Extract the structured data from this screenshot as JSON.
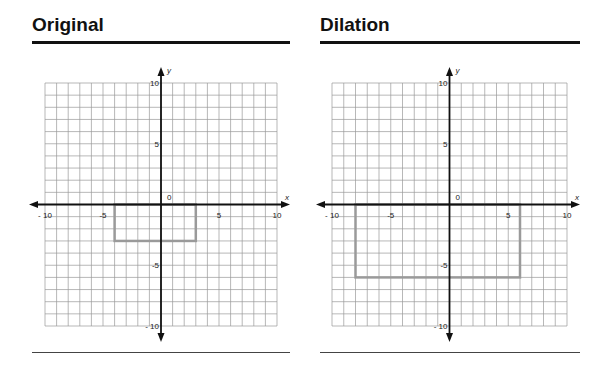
{
  "panels": [
    {
      "title": "Original",
      "x_axis_label": "x",
      "y_axis_label": "y",
      "origin_label": "0",
      "x_ticks": [
        "- 10",
        "-5",
        "5",
        "10"
      ],
      "y_ticks": [
        "10",
        "5",
        "-5",
        "- 10"
      ],
      "shape": {
        "x1": -4,
        "y1": 0,
        "x2": 3,
        "y2": -3
      }
    },
    {
      "title": "Dilation",
      "x_axis_label": "x",
      "y_axis_label": "y",
      "origin_label": "0",
      "x_ticks": [
        "- 10",
        "-5",
        "5",
        "10"
      ],
      "y_ticks": [
        "10",
        "5",
        "-5",
        "- 10"
      ],
      "shape": {
        "x1": -8,
        "y1": 0,
        "x2": 6,
        "y2": -6
      }
    }
  ],
  "colors": {
    "grid": "#9a9a9a",
    "axis": "#111111",
    "shape": "#9a9a9a"
  },
  "chart_data": [
    {
      "type": "scatter",
      "title": "Original",
      "xlabel": "x",
      "ylabel": "y",
      "xlim": [
        -10,
        10
      ],
      "ylim": [
        -10,
        10
      ],
      "grid": true,
      "series": [
        {
          "name": "rectangle",
          "x": [
            -4,
            3,
            3,
            -4,
            -4
          ],
          "y": [
            0,
            0,
            -3,
            -3,
            0
          ]
        }
      ]
    },
    {
      "type": "scatter",
      "title": "Dilation",
      "xlabel": "x",
      "ylabel": "y",
      "xlim": [
        -10,
        10
      ],
      "ylim": [
        -10,
        10
      ],
      "grid": true,
      "series": [
        {
          "name": "rectangle",
          "x": [
            -8,
            6,
            6,
            -8,
            -8
          ],
          "y": [
            0,
            0,
            -6,
            -6,
            0
          ]
        }
      ]
    }
  ]
}
